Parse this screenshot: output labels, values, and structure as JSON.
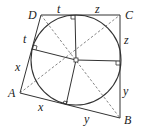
{
  "figure": {
    "type": "tangential-quadrilateral",
    "vertices": {
      "A": {
        "label": "A",
        "x": 20,
        "y": 93
      },
      "B": {
        "label": "B",
        "x": 120,
        "y": 118
      },
      "C": {
        "label": "C",
        "x": 120,
        "y": 15
      },
      "D": {
        "label": "D",
        "x": 41,
        "y": 15
      }
    },
    "incircle": {
      "cx": 76,
      "cy": 60,
      "r": 45
    },
    "tangent_points": {
      "top": {
        "x": 75,
        "y": 15
      },
      "right": {
        "x": 120,
        "y": 61
      },
      "bottom": {
        "x": 66,
        "y": 105
      },
      "left": {
        "x": 32,
        "y": 49
      }
    },
    "segment_labels": {
      "DC_left": "t",
      "DC_right": "z",
      "CB_top": "z",
      "CB_bottom": "y",
      "BA_right": "y",
      "BA_left": "x",
      "AD_bottom": "x",
      "AD_top": "t"
    },
    "colors": {
      "line": "#333333",
      "dashed": "#666666",
      "background": "#ffffff"
    }
  }
}
